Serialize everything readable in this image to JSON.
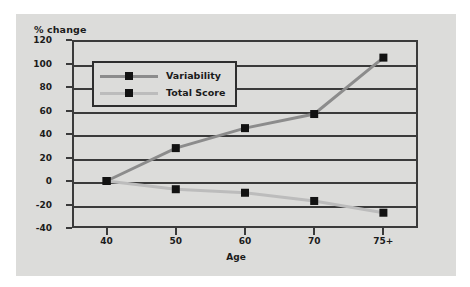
{
  "chart_data": {
    "type": "line",
    "title": "",
    "xlabel": "Age",
    "ylabel": "% change",
    "categories": [
      "40",
      "50",
      "60",
      "70",
      "75+"
    ],
    "ylim": [
      -40,
      120
    ],
    "yticks": [
      120,
      100,
      80,
      60,
      40,
      20,
      0,
      -20,
      -40
    ],
    "ytick_labels": [
      "120",
      "100",
      "80",
      "60",
      "40",
      "20",
      "0",
      "-20",
      "-40"
    ],
    "grid": true,
    "legend_position": "top-left",
    "series": [
      {
        "name": "Variability",
        "color": "#8c8c8c",
        "marker_color": "#121212",
        "values": [
          0,
          28,
          45,
          57,
          105
        ]
      },
      {
        "name": "Total Score",
        "color": "#bcbcbc",
        "marker_color": "#121212",
        "values": [
          0,
          -7,
          -10,
          -17,
          -27
        ]
      }
    ]
  },
  "colors": {
    "figure_background": "#dcdcda",
    "page_background": "#ffffff",
    "axis": "#3a3a3a",
    "text": "#1b1b1b"
  }
}
